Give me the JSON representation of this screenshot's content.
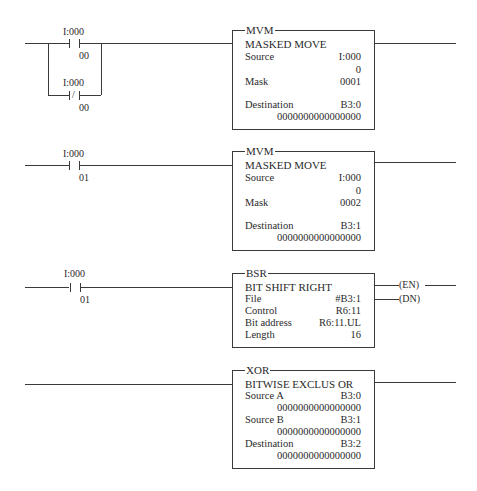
{
  "rungs": [
    {
      "id": 1,
      "contacts": [
        {
          "type": "XIC",
          "address": "I:000",
          "bit": "00"
        },
        {
          "type": "XIO",
          "address": "I:000",
          "bit": "00",
          "slash": "/"
        }
      ],
      "instruction": {
        "mnemonic": "MVM",
        "description": "MASKED MOVE",
        "params": [
          {
            "label": "Source",
            "value": "I:000"
          },
          {
            "label": "",
            "value": "0"
          },
          {
            "label": "Mask",
            "value": "0001"
          },
          {
            "label": "Destination",
            "value": "B3:0"
          },
          {
            "label": "",
            "value": "0000000000000000"
          }
        ]
      }
    },
    {
      "id": 2,
      "contacts": [
        {
          "type": "XIC",
          "address": "I:000",
          "bit": "01"
        }
      ],
      "instruction": {
        "mnemonic": "MVM",
        "description": "MASKED MOVE",
        "params": [
          {
            "label": "Source",
            "value": "I:000"
          },
          {
            "label": "",
            "value": "0"
          },
          {
            "label": "Mask",
            "value": "0002"
          },
          {
            "label": "Destination",
            "value": "B3:1"
          },
          {
            "label": "",
            "value": "0000000000000000"
          }
        ]
      }
    },
    {
      "id": 3,
      "contacts": [
        {
          "type": "XIC",
          "address": "I:000",
          "bit": "01"
        }
      ],
      "instruction": {
        "mnemonic": "BSR",
        "description": "BIT SHIFT RIGHT",
        "params": [
          {
            "label": "File",
            "value": "#B3:1"
          },
          {
            "label": "Control",
            "value": "R6:11"
          },
          {
            "label": "Bit address",
            "value": "R6:11.UL"
          },
          {
            "label": "Length",
            "value": "16"
          }
        ],
        "outputs": [
          "(EN)",
          "(DN)"
        ]
      }
    },
    {
      "id": 4,
      "contacts": [],
      "instruction": {
        "mnemonic": "XOR",
        "description": "BITWISE EXCLUS OR",
        "params": [
          {
            "label": "Source A",
            "value": "B3:0"
          },
          {
            "label": "",
            "value": "0000000000000000"
          },
          {
            "label": "Source B",
            "value": "B3:1"
          },
          {
            "label": "",
            "value": "0000000000000000"
          },
          {
            "label": "Destination",
            "value": "B3:2"
          },
          {
            "label": "",
            "value": "0000000000000000"
          }
        ]
      }
    }
  ]
}
